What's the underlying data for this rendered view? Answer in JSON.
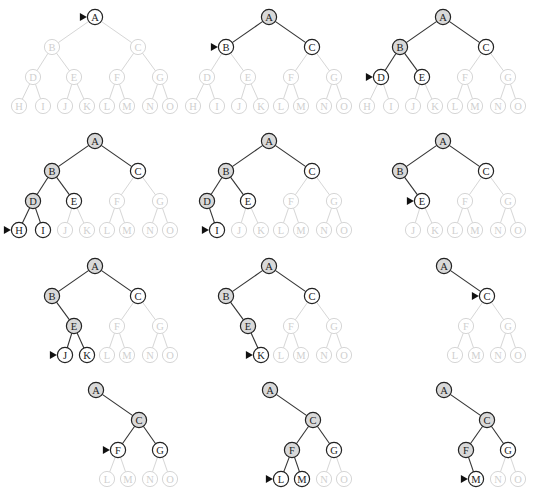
{
  "figure": {
    "legend": {
      "current": "white node with pointer arrow",
      "visited": "gray-filled node",
      "open": "white node with dark outline",
      "faded": "light gray, not yet reached"
    },
    "colors": {
      "visited_fill": "#d9d9d9",
      "outline": "#222222",
      "faded": "#d6d6d6",
      "background": "#ffffff"
    }
  },
  "tree": {
    "nodes": [
      "A",
      "B",
      "C",
      "D",
      "E",
      "F",
      "G",
      "H",
      "I",
      "J",
      "K",
      "L",
      "M",
      "N",
      "O"
    ],
    "edges": [
      [
        "A",
        "B"
      ],
      [
        "A",
        "C"
      ],
      [
        "B",
        "D"
      ],
      [
        "B",
        "E"
      ],
      [
        "C",
        "F"
      ],
      [
        "C",
        "G"
      ],
      [
        "D",
        "H"
      ],
      [
        "D",
        "I"
      ],
      [
        "E",
        "J"
      ],
      [
        "E",
        "K"
      ],
      [
        "F",
        "L"
      ],
      [
        "F",
        "M"
      ],
      [
        "G",
        "N"
      ],
      [
        "G",
        "O"
      ]
    ]
  },
  "panels": [
    {
      "origin": [
        0,
        0
      ],
      "layout": "full",
      "current": "A",
      "visited": [],
      "open": [],
      "removed": []
    },
    {
      "origin": [
        174,
        0
      ],
      "layout": "full",
      "current": "B",
      "visited": [
        "A"
      ],
      "open": [
        "C"
      ],
      "removed": []
    },
    {
      "origin": [
        348,
        0
      ],
      "layout": "full",
      "current": "D",
      "visited": [
        "A",
        "B"
      ],
      "open": [
        "C",
        "E"
      ],
      "removed": []
    },
    {
      "origin": [
        0,
        124
      ],
      "layout": "full",
      "current": "H",
      "visited": [
        "A",
        "B",
        "D"
      ],
      "open": [
        "C",
        "E",
        "I"
      ],
      "removed": []
    },
    {
      "origin": [
        174,
        124
      ],
      "layout": "full",
      "current": "I",
      "visited": [
        "A",
        "B",
        "D"
      ],
      "open": [
        "C",
        "E"
      ],
      "removed": [
        "H"
      ]
    },
    {
      "origin": [
        348,
        124
      ],
      "layout": "full",
      "current": "E",
      "visited": [
        "A",
        "B"
      ],
      "open": [
        "C"
      ],
      "removed": [
        "D",
        "H",
        "I"
      ]
    },
    {
      "origin": [
        0,
        249
      ],
      "layout": "full",
      "current": "J",
      "visited": [
        "A",
        "B",
        "E"
      ],
      "open": [
        "C",
        "K"
      ],
      "removed": [
        "D",
        "H",
        "I"
      ]
    },
    {
      "origin": [
        174,
        249
      ],
      "layout": "full",
      "current": "K",
      "visited": [
        "A",
        "B",
        "E"
      ],
      "open": [
        "C"
      ],
      "removed": [
        "D",
        "H",
        "I",
        "J"
      ]
    },
    {
      "origin": [
        348,
        249
      ],
      "layout": "right",
      "current": "C",
      "visited": [
        "A"
      ],
      "open": [],
      "removed": [
        "B",
        "D",
        "E",
        "H",
        "I",
        "J",
        "K"
      ]
    },
    {
      "origin": [
        0,
        373
      ],
      "layout": "right",
      "current": "F",
      "visited": [
        "A",
        "C"
      ],
      "open": [
        "G"
      ],
      "removed": [
        "B",
        "D",
        "E",
        "H",
        "I",
        "J",
        "K"
      ]
    },
    {
      "origin": [
        174,
        373
      ],
      "layout": "right",
      "current": "L",
      "visited": [
        "A",
        "C",
        "F"
      ],
      "open": [
        "G",
        "M"
      ],
      "removed": [
        "B",
        "D",
        "E",
        "H",
        "I",
        "J",
        "K"
      ]
    },
    {
      "origin": [
        348,
        373
      ],
      "layout": "right",
      "current": "M",
      "visited": [
        "A",
        "C",
        "F"
      ],
      "open": [
        "G"
      ],
      "removed": [
        "B",
        "D",
        "E",
        "H",
        "I",
        "J",
        "K",
        "L"
      ]
    }
  ]
}
